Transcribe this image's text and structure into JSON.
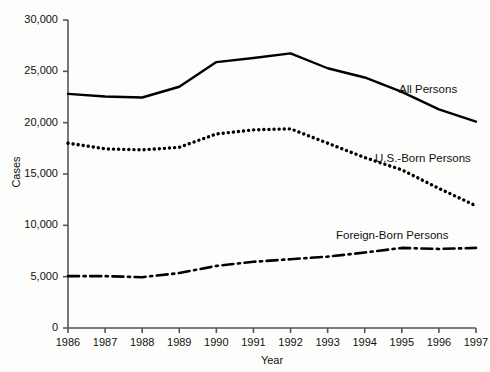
{
  "chart_data": {
    "type": "line",
    "title": "",
    "xlabel": "Year",
    "ylabel": "Cases",
    "x": [
      1986,
      1987,
      1988,
      1989,
      1990,
      1991,
      1992,
      1993,
      1994,
      1995,
      1996,
      1997
    ],
    "categories": [
      "1986",
      "1987",
      "1988",
      "1989",
      "1990",
      "1991",
      "1992",
      "1993",
      "1994",
      "1995",
      "1996",
      "1997"
    ],
    "xlim": [
      1986,
      1997
    ],
    "ylim": [
      0,
      30000
    ],
    "yticks": [
      0,
      5000,
      10000,
      15000,
      20000,
      25000,
      30000
    ],
    "ytick_labels": [
      "0",
      "5,000",
      "10,000",
      "15,000",
      "20,000",
      "25,000",
      "30,000"
    ],
    "grid": false,
    "legend_position": "inline-right",
    "series": [
      {
        "name": "All Persons",
        "style": "solid",
        "color": "#000000",
        "values": [
          22800,
          22550,
          22450,
          23500,
          25900,
          26300,
          26750,
          25300,
          24400,
          23000,
          21300,
          20100
        ]
      },
      {
        "name": "U.S.-Born Persons",
        "style": "dotted",
        "color": "#000000",
        "values": [
          18000,
          17450,
          17350,
          17600,
          18900,
          19300,
          19400,
          18000,
          16600,
          15400,
          13600,
          11900
        ]
      },
      {
        "name": "Foreign-Born Persons",
        "style": "dash-dot",
        "color": "#000000",
        "values": [
          5050,
          5050,
          4950,
          5350,
          6050,
          6450,
          6700,
          6950,
          7350,
          7800,
          7700,
          7800
        ]
      }
    ]
  },
  "axes": {
    "y_title": "Cases",
    "x_title": "Year"
  },
  "labels": {
    "all_persons": "All Persons",
    "us_born_persons": "U.S.-Born Persons",
    "foreign_born_persons": "Foreign-Born Persons"
  },
  "colors": {
    "axis": "#555555",
    "line": "#000000",
    "background": "#fdfdfc",
    "text": "#111111"
  }
}
